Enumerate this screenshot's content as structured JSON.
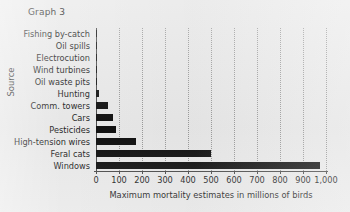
{
  "chart_data": {
    "type": "bar",
    "orientation": "horizontal",
    "title": "Graph 3",
    "xlabel": "Maximum mortality estimates in millions of birds",
    "ylabel": "Source",
    "categories": [
      "Fishing by-catch",
      "Oil spills",
      "Electrocution",
      "Wind turbines",
      "Oil waste pits",
      "Hunting",
      "Comm. towers",
      "Cars",
      "Pesticides",
      "High-tension wires",
      "Feral cats",
      "Windows"
    ],
    "values": [
      2,
      2,
      2,
      2,
      5,
      12,
      50,
      75,
      85,
      175,
      500,
      975
    ],
    "xlim": [
      0,
      1000
    ],
    "xticks": [
      0,
      100,
      200,
      300,
      400,
      500,
      600,
      700,
      800,
      900,
      1000
    ],
    "xtick_labels": [
      "0",
      "100",
      "200",
      "300",
      "400",
      "500",
      "600",
      "700",
      "800",
      "900",
      "1,000"
    ],
    "grid": "vertical-dotted",
    "legend": "none",
    "bar_color": "#111111",
    "background_color": "#e9e9e9",
    "axis_color": "#4a4a4a",
    "gridline_color": "#9a9a9a"
  }
}
